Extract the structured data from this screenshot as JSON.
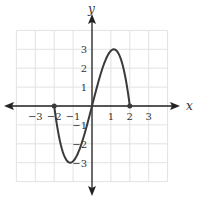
{
  "chart_data": {
    "type": "line",
    "title": "",
    "xlabel": "x",
    "ylabel": "y",
    "xlim": [
      -4,
      4
    ],
    "ylim": [
      -4,
      4
    ],
    "grid": true,
    "x_ticks": [
      -3,
      -2,
      -1,
      1,
      2,
      3
    ],
    "y_ticks": [
      -3,
      -2,
      -1,
      1,
      2,
      3
    ],
    "x_tick_labels": [
      "−3",
      "−2",
      "−1",
      "1",
      "2",
      "3"
    ],
    "y_tick_labels": [
      "−3",
      "−2",
      "−1",
      "1",
      "2",
      "3"
    ],
    "series": [
      {
        "name": "f(x)",
        "domain": [
          -2,
          2
        ],
        "endpoints_closed": [
          [
            -2,
            0
          ],
          [
            2,
            0
          ]
        ],
        "x": [
          -2,
          -1.5,
          -1.155,
          -1,
          -0.5,
          0,
          0.5,
          1,
          1.155,
          1.5,
          2
        ],
        "y": [
          0,
          -2.56,
          -3,
          -2.92,
          -1.83,
          0,
          1.83,
          2.92,
          3,
          2.56,
          0
        ]
      }
    ],
    "key_points": {
      "zeros": [
        -2,
        0,
        2
      ],
      "local_max": [
        1.15,
        3
      ],
      "local_min": [
        -1.15,
        -3
      ]
    }
  },
  "labels": {
    "x_axis": "x",
    "y_axis": "y"
  },
  "colors": {
    "curve": "#3a3a3a",
    "axis": "#222222",
    "grid": "#e2e2e2"
  }
}
